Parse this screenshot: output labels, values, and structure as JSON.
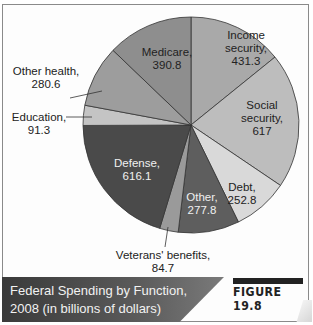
{
  "chart_data": {
    "type": "pie",
    "title": "Federal Spending by Function, 2008 (in billions of dollars)",
    "figure_label": "FIGURE 19.8",
    "units": "billions of dollars",
    "start_angle_deg": 0,
    "direction": "clockwise",
    "slices": [
      {
        "name": "Income security",
        "value": 431.3,
        "color": "#a9a9a9"
      },
      {
        "name": "Social security",
        "value": 617,
        "color": "#bdbdbd"
      },
      {
        "name": "Debt",
        "value": 252.8,
        "color": "#d9d9d9"
      },
      {
        "name": "Other",
        "value": 277.8,
        "color": "#5e5e5e"
      },
      {
        "name": "Veterans' benefits",
        "value": 84.7,
        "color": "#9a9a9a"
      },
      {
        "name": "Defense",
        "value": 616.1,
        "color": "#4a4a4a"
      },
      {
        "name": "Education",
        "value": 91.3,
        "color": "#c4c4c4"
      },
      {
        "name": "Other health",
        "value": 280.6,
        "color": "#9d9d9d"
      },
      {
        "name": "Medicare",
        "value": 390.8,
        "color": "#8e8e8e"
      }
    ]
  },
  "labels": {
    "income_security": {
      "line1": "Income",
      "line2": "security,",
      "line3": "431.3"
    },
    "social_security": {
      "line1": "Social",
      "line2": "security,",
      "line3": "617"
    },
    "debt": {
      "line1": "Debt,",
      "line2": "252.8"
    },
    "other": {
      "line1": "Other,",
      "line2": "277.8"
    },
    "veterans": {
      "line1": "Veterans' benefits,",
      "line2": "84.7"
    },
    "defense": {
      "line1": "Defense,",
      "line2": "616.1"
    },
    "education": {
      "line1": "Education,",
      "line2": "91.3"
    },
    "other_health": {
      "line1": "Other health,",
      "line2": "280.6"
    },
    "medicare": {
      "line1": "Medicare,",
      "line2": "390.8"
    }
  },
  "caption": {
    "line1": "Federal Spending by Function,",
    "line2": "2008 (in billions of dollars)",
    "figure": "FIGURE 19.8"
  }
}
